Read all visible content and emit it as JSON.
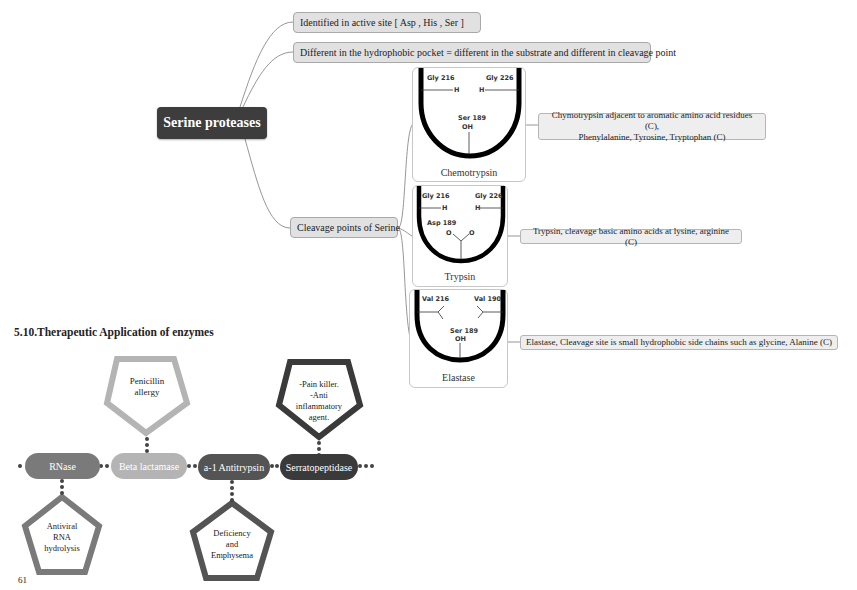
{
  "mindmap": {
    "root": "Serine proteases",
    "branches": [
      {
        "label": "Identified in active site [ Asp , His , Ser ]"
      },
      {
        "label": "Different in the hydrophobic pocket = different in the substrate and different in cleavage point"
      },
      {
        "label": "Cleavage points of Serine"
      }
    ],
    "enzymes": [
      {
        "name": "Chemotrypsin",
        "residues": {
          "left": "Gly 216",
          "right": "Gly 226",
          "center": "Ser 189",
          "left_group": "H",
          "right_group": "H",
          "center_group": "OH"
        },
        "note": [
          "Chymotrypsin adjacent to aromatic amino acid residues (C),",
          "Phenylalanine, Tyrosine, Tryptophan (C)"
        ]
      },
      {
        "name": "Trypsin",
        "residues": {
          "left": "Gly 216",
          "right": "Gly 226",
          "center": "Asp 189",
          "left_group": "H",
          "right_group": "H",
          "center_group_left": "O",
          "center_group_right": "O"
        },
        "note": [
          "Trypsin, cleavage basic amino acids at lysine, arginine (C)"
        ]
      },
      {
        "name": "Elastase",
        "residues": {
          "left": "Val 216",
          "right": "Val 190",
          "center": "Ser 189",
          "center_group": "OH"
        },
        "note": [
          "Elastase, Cleavage site is small hydrophobic side chains such as glycine, Alanine (C)"
        ]
      }
    ]
  },
  "section": {
    "title": "5.10.Therapeutic Application of enzymes",
    "pills": [
      {
        "label": "RNase",
        "color": "#7a7a7a"
      },
      {
        "label": "Beta lactamase",
        "color": "#b4b4b4"
      },
      {
        "label": "a-1 Antitrypsin",
        "color": "#545454"
      },
      {
        "label": "Serratopeptidase",
        "color": "#3a3a3a"
      }
    ],
    "pentagons": [
      {
        "attached_to": "Beta lactamase",
        "position": "above",
        "lines": [
          "Penicillin",
          "allergy"
        ],
        "color": "#b4b4b4"
      },
      {
        "attached_to": "Serratopeptidase",
        "position": "above",
        "lines": [
          "-Pain killer.",
          "-Anti",
          "inflammatory",
          "agent."
        ],
        "color": "#3a3a3a"
      },
      {
        "attached_to": "RNase",
        "position": "below",
        "lines": [
          "Antiviral",
          "RNA",
          "hydrolysis"
        ],
        "color": "#7a7a7a"
      },
      {
        "attached_to": "a-1 Antitrypsin",
        "position": "below",
        "lines": [
          "Deficiency",
          "and",
          "Emphysema"
        ],
        "color": "#545454"
      }
    ]
  },
  "page_number": "61"
}
